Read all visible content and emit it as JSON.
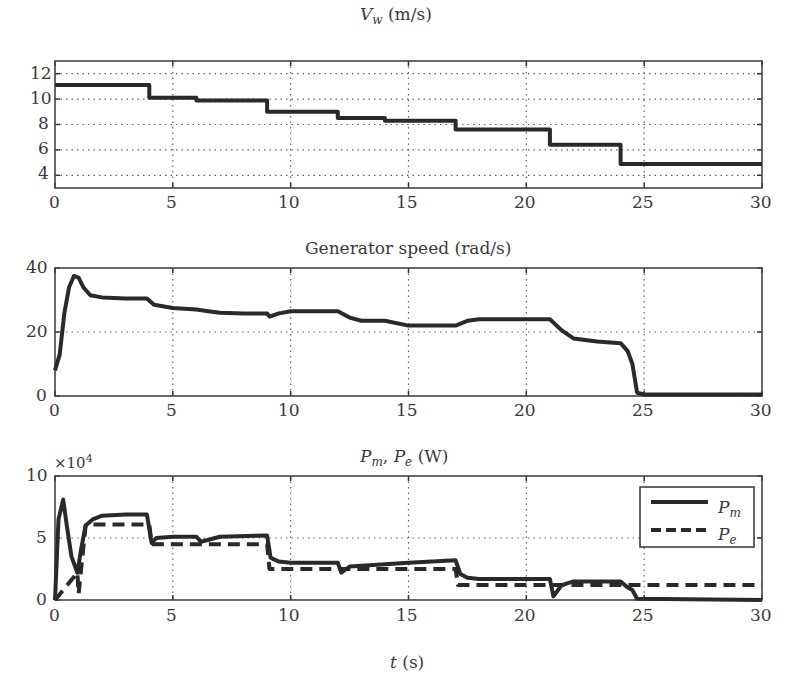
{
  "figure": {
    "xlabel_var": "t",
    "xlabel_unit": "(s)",
    "xticks": [
      "0",
      "5",
      "10",
      "15",
      "20",
      "25",
      "30"
    ]
  },
  "panels": [
    {
      "title_var": "V",
      "title_sub": "w",
      "title_unit": "(m/s)",
      "yticks": [
        "12",
        "10",
        "8",
        "6",
        "4"
      ]
    },
    {
      "title_text": "Generator speed (rad/s)",
      "yticks": [
        "40",
        "20",
        "0"
      ]
    },
    {
      "title_p1": "P",
      "title_s1": "m",
      "title_p2": "P",
      "title_s2": "e",
      "title_unit": "(W)",
      "multiplier": "×10",
      "multiplier_exp": "4",
      "yticks": [
        "10",
        "5",
        "0"
      ],
      "legend": [
        {
          "label": "P",
          "sub": "m",
          "style": "solid"
        },
        {
          "label": "P",
          "sub": "e",
          "style": "dashed"
        }
      ]
    }
  ],
  "chart_data": [
    {
      "type": "line",
      "title": "V_w (m/s)",
      "xlabel": "",
      "ylabel": "",
      "xlim": [
        0,
        30
      ],
      "ylim": [
        3,
        13
      ],
      "xticks": [
        0,
        5,
        10,
        15,
        20,
        25,
        30
      ],
      "yticks": [
        4,
        6,
        8,
        10,
        12
      ],
      "grid": true,
      "series": [
        {
          "name": "V_w",
          "style": "solid-step",
          "x": [
            0,
            4,
            4,
            6,
            6,
            9,
            9,
            12,
            12,
            14,
            14,
            17,
            17,
            21,
            21,
            24,
            24,
            30
          ],
          "y": [
            11.1,
            11.1,
            10.1,
            10.1,
            9.9,
            9.9,
            9.0,
            9.0,
            8.5,
            8.5,
            8.3,
            8.3,
            7.6,
            7.6,
            6.4,
            6.4,
            4.9,
            4.9
          ]
        }
      ]
    },
    {
      "type": "line",
      "title": "Generator speed (rad/s)",
      "xlabel": "",
      "ylabel": "",
      "xlim": [
        0,
        30
      ],
      "ylim": [
        0,
        40
      ],
      "xticks": [
        0,
        5,
        10,
        15,
        20,
        25,
        30
      ],
      "yticks": [
        0,
        20,
        40
      ],
      "grid": true,
      "series": [
        {
          "name": "Generator speed",
          "style": "solid",
          "x": [
            0,
            0.2,
            0.4,
            0.6,
            0.8,
            1.0,
            1.2,
            1.5,
            2,
            3,
            3.9,
            4.2,
            5,
            6,
            6.5,
            7,
            8,
            9,
            9.1,
            9.5,
            10,
            11,
            12,
            12.5,
            13,
            14,
            15,
            16,
            17,
            17.5,
            18,
            19,
            20,
            21,
            21.5,
            22,
            23,
            24,
            24.3,
            24.5,
            24.7,
            25,
            30
          ],
          "y": [
            8,
            13,
            26,
            34,
            37.5,
            37,
            34,
            31.5,
            30.8,
            30.5,
            30.5,
            28.5,
            27.5,
            27,
            26.5,
            26,
            25.8,
            25.8,
            24.8,
            25.8,
            26.5,
            26.5,
            26.5,
            24.5,
            23.5,
            23.5,
            22,
            22,
            22,
            23.5,
            24,
            24,
            24,
            24,
            20.5,
            18,
            17,
            16.5,
            14,
            10,
            1,
            0.5,
            0.5
          ]
        }
      ]
    },
    {
      "type": "line",
      "title": "P_m, P_e (W)",
      "xlabel": "t (s)",
      "ylabel": "",
      "y_multiplier": "x10^4",
      "xlim": [
        0,
        30
      ],
      "ylim": [
        0,
        10
      ],
      "xticks": [
        0,
        5,
        10,
        15,
        20,
        25,
        30
      ],
      "yticks": [
        0,
        5,
        10
      ],
      "grid": true,
      "legend_position": "upper right",
      "series": [
        {
          "name": "P_m",
          "style": "solid",
          "x": [
            0,
            0.15,
            0.35,
            0.5,
            0.7,
            0.95,
            1.1,
            1.3,
            1.6,
            2,
            3,
            3.9,
            4.1,
            4.3,
            5,
            6,
            6.2,
            7,
            9,
            9.15,
            9.5,
            10,
            12,
            12.15,
            12.5,
            15,
            17,
            17.2,
            17.5,
            18,
            20,
            21,
            21.15,
            21.5,
            22,
            24,
            24.3,
            24.5,
            24.7,
            30
          ],
          "y": [
            0,
            6.5,
            8.1,
            6,
            3.5,
            2.2,
            4,
            6,
            6.5,
            6.8,
            6.9,
            6.9,
            4.6,
            5.0,
            5.1,
            5.1,
            4.7,
            5.1,
            5.2,
            3.4,
            3.1,
            3.0,
            3.0,
            2.2,
            2.7,
            3.0,
            3.2,
            2.1,
            1.8,
            1.7,
            1.7,
            1.7,
            0.3,
            1.2,
            1.5,
            1.5,
            1.0,
            0.8,
            0.1,
            0.0
          ]
        },
        {
          "name": "P_e",
          "style": "dashed",
          "x": [
            0,
            0.95,
            1.0,
            1.3,
            1.6,
            4,
            4.1,
            9,
            9.1,
            17,
            17.1,
            30
          ],
          "y": [
            0,
            2.2,
            0.5,
            6,
            6.1,
            6.1,
            4.5,
            4.5,
            2.5,
            2.5,
            1.2,
            1.2
          ]
        }
      ]
    }
  ]
}
